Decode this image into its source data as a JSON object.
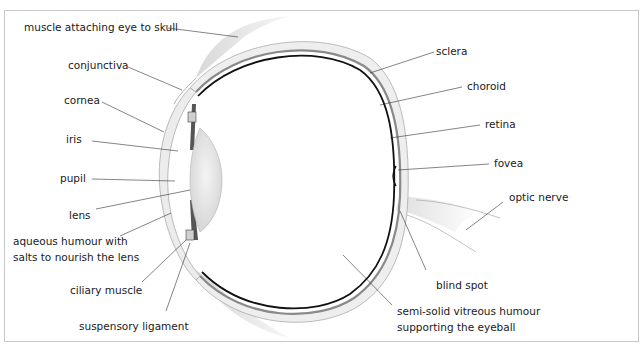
{
  "diagram": {
    "type": "anatomical cross-section",
    "colors": {
      "frame": "#c8c8c8",
      "leader_line": "#333333",
      "sclera_fill": "#efefef",
      "sclera_outline": "#9a9a9a",
      "choroid": "#7a7a7a",
      "retina": "#111111",
      "lens_fill": "#e4e4e4",
      "muscle_fill": "#dcdcdc",
      "text": "#1a1a1a"
    },
    "labels": {
      "muscle": "muscle attaching eye to skull",
      "conjunctiva": "conjunctiva",
      "cornea": "cornea",
      "iris": "iris",
      "pupil": "pupil",
      "lens": "lens",
      "aqueous": "aqueous humour with\nsalts to nourish the lens",
      "ciliary": "ciliary muscle",
      "suspensory": "suspensory ligament",
      "sclera": "sclera",
      "choroid": "choroid",
      "retina": "retina",
      "fovea": "fovea",
      "optic_nerve": "optic nerve",
      "blind_spot": "blind spot",
      "vitreous": "semi-solid vitreous humour\nsupporting the eyeball"
    }
  }
}
